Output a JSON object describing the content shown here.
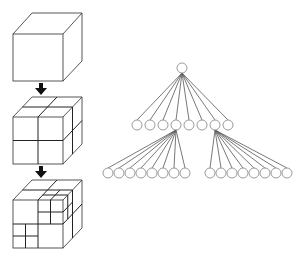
{
  "diagram": {
    "colors": {
      "line": "#444444",
      "edge": "#555555",
      "node_stroke": "#9a9a9a",
      "arrow": "#111111",
      "background": "#ffffff"
    },
    "cubes": [
      {
        "label": "level-0",
        "subdivision": "none"
      },
      {
        "label": "level-1",
        "subdivision": "2x2x2"
      },
      {
        "label": "level-2",
        "subdivision": "2x2x2 with two octants further subdivided"
      }
    ],
    "arrows": [
      {
        "from": "level-0",
        "to": "level-1",
        "icon": "down-arrow"
      },
      {
        "from": "level-1",
        "to": "level-2",
        "icon": "down-arrow"
      }
    ],
    "tree": {
      "root": {
        "x": 182,
        "y": 68
      },
      "level1": {
        "y": 125,
        "x": [
          137,
          150,
          163,
          176,
          189,
          202,
          215,
          228
        ],
        "expanded_children_indices": [
          3,
          6
        ]
      },
      "level2_left": {
        "y": 173,
        "parent_index": 3,
        "x": [
          108,
          119,
          130,
          141,
          152,
          163,
          174,
          185
        ]
      },
      "level2_right": {
        "y": 173,
        "parent_index": 6,
        "x": [
          210,
          221,
          232,
          243,
          254,
          265,
          276,
          287
        ]
      },
      "node_radius": 5
    }
  }
}
